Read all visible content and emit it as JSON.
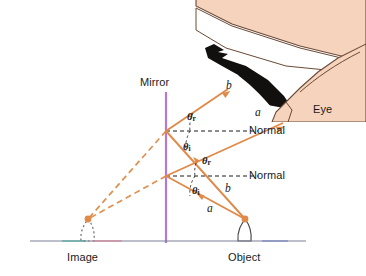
{
  "figure": {
    "type": "optics-ray-diagram",
    "background_color": "#ffffff"
  },
  "colors": {
    "mirror": "#b57ad0",
    "ray": "#e08a4a",
    "ray_dashed": "#e09050",
    "normal": "#1a1a1a",
    "skin": "#f6d3bd",
    "skin_outline": "#6b4a36",
    "eye_dark": "#12100e",
    "baseline": "#7a7f96",
    "baseline_accent_pink": "#d47e96",
    "baseline_accent_teal": "#4aa69a",
    "baseline_accent_blue": "#6f7fc0",
    "object_outline": "#4a4a4a",
    "image_outline": "#6a6a6a",
    "label_text": "#1a1a1a"
  },
  "labels": {
    "mirror": "Mirror",
    "eye": "Eye",
    "normal_upper": "Normal",
    "normal_lower": "Normal",
    "image": "Image",
    "object": "Object"
  },
  "ray_labels": {
    "b_upper": "b",
    "a_upper": "a",
    "b_lower": "b",
    "a_lower": "a"
  },
  "angle_labels": {
    "upper_reflected": {
      "symbol": "θ",
      "subscript": "r",
      "meaning": "angle of reflection"
    },
    "upper_incident": {
      "symbol": "θ",
      "subscript": "i",
      "meaning": "angle of incidence"
    },
    "lower_reflected": {
      "symbol": "θ",
      "subscript": "r",
      "meaning": "angle of reflection"
    },
    "lower_incident": {
      "symbol": "θ",
      "subscript": "i",
      "meaning": "angle of incidence"
    }
  },
  "geometry": {
    "mirror_line": {
      "x": 166,
      "y_top": 92,
      "y_bottom": 243
    },
    "baseline": {
      "x_start": 30,
      "x_end": 306,
      "y": 241
    },
    "object_tip": {
      "x": 245,
      "y": 219
    },
    "image_tip": {
      "x": 88,
      "y": 219
    },
    "reflection_point_upper": {
      "x": 166,
      "y": 131
    },
    "reflection_point_lower": {
      "x": 166,
      "y": 176
    },
    "normal_upper": {
      "x_start": 166,
      "x_end": 258,
      "y": 131
    },
    "normal_lower": {
      "x_start": 166,
      "x_end": 258,
      "y": 176
    },
    "ray_b_upper_end": {
      "x": 228,
      "y": 89
    },
    "ray_a_upper_end": {
      "x": 283,
      "y": 123
    }
  }
}
